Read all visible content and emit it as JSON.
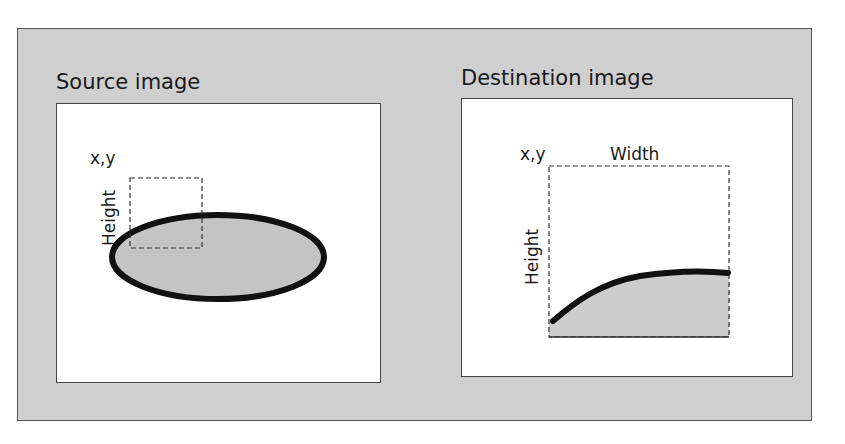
{
  "diagram": {
    "source": {
      "title": "Source image",
      "origin_label": "x,y",
      "height_label": "Height"
    },
    "destination": {
      "title": "Destination image",
      "origin_label": "x,y",
      "width_label": "Width",
      "height_label": "Height"
    },
    "colors": {
      "frame_bg": "#cfcfcf",
      "panel_bg": "#ffffff",
      "shape_fill": "#c4c4c4",
      "stroke": "#111111"
    }
  }
}
